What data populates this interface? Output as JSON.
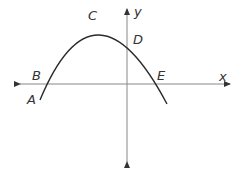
{
  "diagram": {
    "type": "parabola-on-coordinate-plane",
    "axes": {
      "x_label": "x",
      "y_label": "y",
      "color": "#777777"
    },
    "curve": {
      "color": "#2a2a2a",
      "description": "downward-opening parabola"
    },
    "points": [
      {
        "label": "A",
        "role": "curve endpoint below x-axis (left)"
      },
      {
        "label": "B",
        "role": "left x-intercept"
      },
      {
        "label": "C",
        "role": "vertex (maximum)"
      },
      {
        "label": "D",
        "role": "y-intercept"
      },
      {
        "label": "E",
        "role": "right x-intercept"
      }
    ]
  }
}
